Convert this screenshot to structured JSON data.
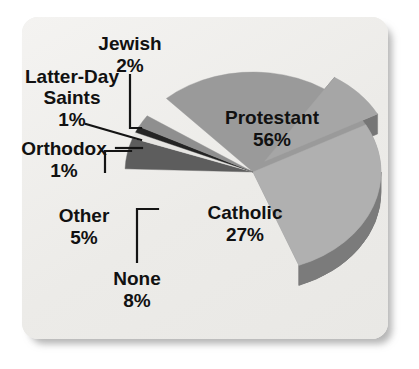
{
  "chart_data": {
    "type": "pie",
    "title": "",
    "subtitle": "",
    "xlabel": "",
    "ylabel": "",
    "legend_position": "none",
    "grid": false,
    "style": "3d-exploded",
    "units": "percent",
    "categories": [
      "Protestant",
      "Catholic",
      "None",
      "Other",
      "Orthodox",
      "Latter-Day Saints",
      "Jewish"
    ],
    "values": [
      56,
      27,
      8,
      5,
      1,
      1,
      2
    ],
    "slices": [
      {
        "label": "Protestant",
        "value": 56,
        "value_text": "56%",
        "label_placement": "inside",
        "color": "#9a9a9a",
        "side_color": "#6f6f6f",
        "exploded": false,
        "start_angle": -69,
        "end_angle": 132.6
      },
      {
        "label": "Catholic",
        "value": 27,
        "value_text": "27%",
        "label_placement": "inside",
        "color": "#b0b0b0",
        "side_color": "#7b7b7b",
        "exploded": false,
        "start_angle": -69,
        "end_angle": 28.2
      },
      {
        "label": "None",
        "value": 8,
        "value_text": "8%",
        "label_placement": "outside",
        "color": "#a6a6a6",
        "side_color": "#767676",
        "exploded": true,
        "start_angle": 28.2,
        "end_angle": 57
      },
      {
        "label": "Other",
        "value": 5,
        "value_text": "5%",
        "label_placement": "outside",
        "color": "#5d5d5d",
        "side_color": "#3e3e3e",
        "exploded": false,
        "start_angle": 160.2,
        "end_angle": 178.2
      },
      {
        "label": "Orthodox",
        "value": 1,
        "value_text": "1%",
        "label_placement": "outside",
        "color": "#e6e5e2",
        "side_color": "#b4b3b0",
        "exploded": false,
        "start_angle": 156.6,
        "end_angle": 160.2
      },
      {
        "label": "Latter-Day Saints",
        "value": 1,
        "value_text": "1%",
        "label_placement": "outside",
        "color": "#242424",
        "side_color": "#161616",
        "exploded": false,
        "start_angle": 153,
        "end_angle": 156.6
      },
      {
        "label": "Jewish",
        "value": 2,
        "value_text": "2%",
        "label_placement": "outside",
        "color": "#8f8f8f",
        "side_color": "#666666",
        "exploded": false,
        "start_angle": 145.8,
        "end_angle": 153
      }
    ],
    "labels": {
      "jewish": {
        "name": "Jewish",
        "percent": "2%"
      },
      "latter_day_saints_line1": "Latter-Day",
      "latter_day_saints_line2": "Saints",
      "latter_day_saints_percent": "1%",
      "orthodox": {
        "name": "Orthodox",
        "percent": "1%"
      },
      "other": {
        "name": "Other",
        "percent": "5%"
      },
      "none": {
        "name": "None",
        "percent": "8%"
      },
      "protestant": {
        "name": "Protestant",
        "percent": "56%"
      },
      "catholic": {
        "name": "Catholic",
        "percent": "27%"
      }
    }
  },
  "figure": {
    "background_color": "#ffffff",
    "card_color": "#efeeec",
    "text_color": "#111111",
    "leader_color": "#141414"
  }
}
